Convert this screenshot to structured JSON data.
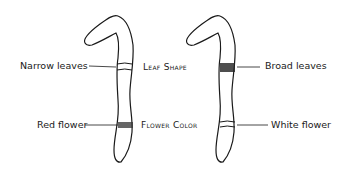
{
  "diagram": {
    "left_chromosome": {
      "labels": {
        "upper": "Narrow leaves",
        "lower": "Red flower"
      }
    },
    "right_chromosome": {
      "labels": {
        "upper": "Broad leaves",
        "lower": "White flower"
      }
    },
    "traits": {
      "upper": "Leaf Shape",
      "lower": "Flower Color"
    }
  }
}
